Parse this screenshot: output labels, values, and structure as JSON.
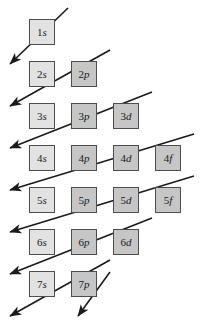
{
  "diagram": {
    "box_size": 26,
    "col_step": 42,
    "row_step": 42,
    "origin_x": 29,
    "origin_y": 19,
    "colors": {
      "s_fill": "#e2e2e2",
      "pdf_fill": "#c6c6c6",
      "box_border": "#4d4d4d",
      "arrow": "#1a1a1a",
      "background": "#ffffff",
      "text": "#1a1a1a"
    },
    "orbitals": [
      {
        "name": "1s",
        "n": "1",
        "l": "s",
        "row": 0,
        "col": 0,
        "type": "s"
      },
      {
        "name": "2s",
        "n": "2",
        "l": "s",
        "row": 1,
        "col": 0,
        "type": "s"
      },
      {
        "name": "2p",
        "n": "2",
        "l": "p",
        "row": 1,
        "col": 1,
        "type": "p"
      },
      {
        "name": "3s",
        "n": "3",
        "l": "s",
        "row": 2,
        "col": 0,
        "type": "s"
      },
      {
        "name": "3p",
        "n": "3",
        "l": "p",
        "row": 2,
        "col": 1,
        "type": "p"
      },
      {
        "name": "3d",
        "n": "3",
        "l": "d",
        "row": 2,
        "col": 2,
        "type": "d"
      },
      {
        "name": "4s",
        "n": "4",
        "l": "s",
        "row": 3,
        "col": 0,
        "type": "s"
      },
      {
        "name": "4p",
        "n": "4",
        "l": "p",
        "row": 3,
        "col": 1,
        "type": "p"
      },
      {
        "name": "4d",
        "n": "4",
        "l": "d",
        "row": 3,
        "col": 2,
        "type": "d"
      },
      {
        "name": "4f",
        "n": "4",
        "l": "f",
        "row": 3,
        "col": 3,
        "type": "f"
      },
      {
        "name": "5s",
        "n": "5",
        "l": "s",
        "row": 4,
        "col": 0,
        "type": "s"
      },
      {
        "name": "5p",
        "n": "5",
        "l": "p",
        "row": 4,
        "col": 1,
        "type": "p"
      },
      {
        "name": "5d",
        "n": "5",
        "l": "d",
        "row": 4,
        "col": 2,
        "type": "d"
      },
      {
        "name": "5f",
        "n": "5",
        "l": "f",
        "row": 4,
        "col": 3,
        "type": "f"
      },
      {
        "name": "6s",
        "n": "6",
        "l": "s",
        "row": 5,
        "col": 0,
        "type": "s"
      },
      {
        "name": "6p",
        "n": "6",
        "l": "p",
        "row": 5,
        "col": 1,
        "type": "p"
      },
      {
        "name": "6d",
        "n": "6",
        "l": "d",
        "row": 5,
        "col": 2,
        "type": "d"
      },
      {
        "name": "7s",
        "n": "7",
        "l": "s",
        "row": 6,
        "col": 0,
        "type": "s"
      },
      {
        "name": "7p",
        "n": "7",
        "l": "p",
        "row": 6,
        "col": 1,
        "type": "p"
      }
    ],
    "arrows": [
      {
        "name": "arrow-1s",
        "x1": 68,
        "y1": 8,
        "x2": 10,
        "y2": 64
      },
      {
        "name": "arrow-2s-2p",
        "x1": 110,
        "y1": 50,
        "x2": 10,
        "y2": 106
      },
      {
        "name": "arrow-3s-3p-3d",
        "x1": 152,
        "y1": 92,
        "x2": 10,
        "y2": 148
      },
      {
        "name": "arrow-4s-4p-4d-4f",
        "x1": 194,
        "y1": 134,
        "x2": 10,
        "y2": 190
      },
      {
        "name": "arrow-5s-5p-5d-5f",
        "x1": 194,
        "y1": 176,
        "x2": 10,
        "y2": 232
      },
      {
        "name": "arrow-6s-6p-6d",
        "x1": 152,
        "y1": 218,
        "x2": 10,
        "y2": 274
      },
      {
        "name": "arrow-7s-7p",
        "x1": 110,
        "y1": 260,
        "x2": 10,
        "y2": 316
      },
      {
        "name": "arrow-tail-bottom",
        "x1": 110,
        "y1": 272,
        "x2": 78,
        "y2": 316
      }
    ]
  }
}
